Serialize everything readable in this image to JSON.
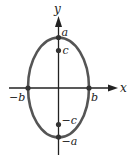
{
  "diagram": {
    "type": "ellipse",
    "axes": {
      "x_label": "x",
      "y_label": "y"
    },
    "points": [
      {
        "id": "a",
        "label": "a",
        "position": "top vertex on y-axis"
      },
      {
        "id": "c",
        "label": "c",
        "position": "upper focus on y-axis"
      },
      {
        "id": "neg_c",
        "label": "−c",
        "position": "lower focus on y-axis"
      },
      {
        "id": "neg_a",
        "label": "−a",
        "position": "bottom vertex on y-axis"
      },
      {
        "id": "b",
        "label": "b",
        "position": "right co-vertex on x-axis"
      },
      {
        "id": "neg_b",
        "label": "−b",
        "position": "left co-vertex on x-axis"
      }
    ],
    "colors": {
      "ellipse": "#555555",
      "axes": "#222222",
      "points": "#333333"
    }
  }
}
